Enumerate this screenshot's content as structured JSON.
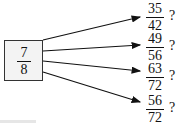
{
  "source": {
    "numerator": "7",
    "denominator": "8"
  },
  "targets": [
    {
      "numerator": "35",
      "denominator": "42",
      "mark": "?"
    },
    {
      "numerator": "49",
      "denominator": "56",
      "mark": "?"
    },
    {
      "numerator": "63",
      "denominator": "72",
      "mark": "?"
    },
    {
      "numerator": "56",
      "denominator": "72",
      "mark": "?"
    }
  ]
}
